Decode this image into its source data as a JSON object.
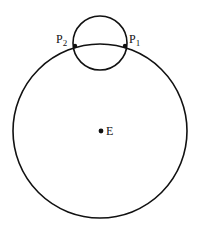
{
  "diagram": {
    "large_circle": {
      "cx": 100,
      "cy": 131,
      "r": 87
    },
    "small_circle": {
      "cx": 100,
      "cy": 43,
      "r": 27
    },
    "points": [
      {
        "name": "P",
        "sub": "2",
        "x": 75,
        "y": 46
      },
      {
        "name": "P",
        "sub": "1",
        "x": 125,
        "y": 46
      }
    ],
    "center": {
      "label": "E",
      "x": 100,
      "y": 131
    },
    "labels": {
      "p2_main": "P",
      "p2_sub": "2",
      "p1_main": "P",
      "p1_sub": "1",
      "center": "E"
    },
    "stroke_color": "#111111"
  }
}
